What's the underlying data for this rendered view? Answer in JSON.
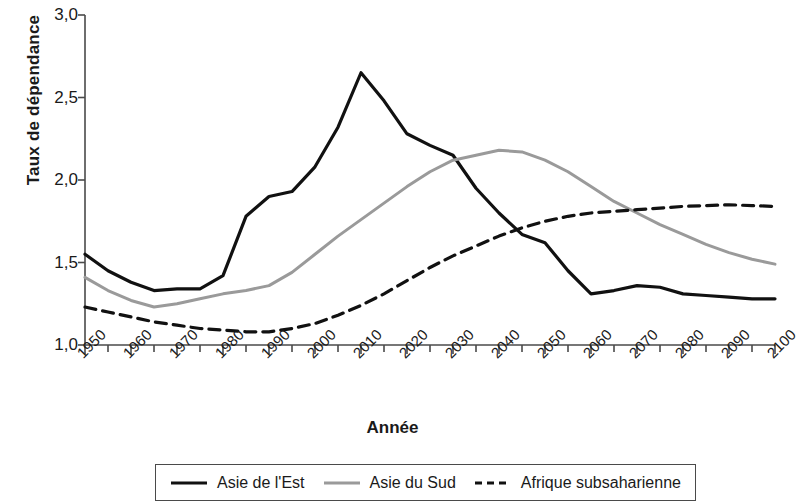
{
  "chart_data": {
    "type": "line",
    "title": "",
    "xlabel": "Année",
    "ylabel": "Taux de dépendance",
    "xlim": [
      1950,
      2100
    ],
    "ylim": [
      1.0,
      3.0
    ],
    "yticks": [
      "1,0",
      "1,5",
      "2,0",
      "2,5",
      "3,0"
    ],
    "ytick_values": [
      1.0,
      1.5,
      2.0,
      2.5,
      3.0
    ],
    "xticks": [
      "1950",
      "1960",
      "1970",
      "1980",
      "1990",
      "2000",
      "2010",
      "2020",
      "2030",
      "2040",
      "2050",
      "2060",
      "2070",
      "2080",
      "2090",
      "2100"
    ],
    "xtick_values": [
      1950,
      1960,
      1970,
      1980,
      1990,
      2000,
      2010,
      2020,
      2030,
      2040,
      2050,
      2060,
      2070,
      2080,
      2090,
      2100
    ],
    "minor_tick_step": 5,
    "grid": false,
    "legend_position": "bottom",
    "x": [
      1950,
      1955,
      1960,
      1965,
      1970,
      1975,
      1980,
      1985,
      1990,
      1995,
      2000,
      2005,
      2010,
      2015,
      2020,
      2025,
      2030,
      2035,
      2040,
      2045,
      2050,
      2055,
      2060,
      2065,
      2070,
      2075,
      2080,
      2085,
      2090,
      2095,
      2100
    ],
    "series": [
      {
        "name": "Asie de l'Est",
        "color": "#111111",
        "style": "solid",
        "width": 3.2,
        "values": [
          1.55,
          1.45,
          1.38,
          1.33,
          1.34,
          1.34,
          1.42,
          1.78,
          1.9,
          1.93,
          2.08,
          2.32,
          2.65,
          2.48,
          2.28,
          2.21,
          2.15,
          1.95,
          1.8,
          1.67,
          1.62,
          1.45,
          1.31,
          1.33,
          1.36,
          1.35,
          1.31,
          1.3,
          1.29,
          1.28,
          1.28
        ]
      },
      {
        "name": "Asie du Sud",
        "color": "#9a9a9a",
        "style": "solid",
        "width": 3.0,
        "values": [
          1.41,
          1.33,
          1.27,
          1.23,
          1.25,
          1.28,
          1.31,
          1.33,
          1.36,
          1.44,
          1.55,
          1.66,
          1.76,
          1.86,
          1.96,
          2.05,
          2.12,
          2.15,
          2.18,
          2.17,
          2.12,
          2.05,
          1.96,
          1.87,
          1.8,
          1.73,
          1.67,
          1.61,
          1.56,
          1.52,
          1.49
        ]
      },
      {
        "name": "Afrique subsaharienne",
        "color": "#111111",
        "style": "dashed",
        "width": 3.2,
        "values": [
          1.23,
          1.2,
          1.17,
          1.14,
          1.12,
          1.1,
          1.09,
          1.08,
          1.08,
          1.1,
          1.13,
          1.18,
          1.24,
          1.31,
          1.39,
          1.47,
          1.54,
          1.6,
          1.66,
          1.71,
          1.75,
          1.78,
          1.8,
          1.81,
          1.82,
          1.83,
          1.84,
          1.845,
          1.85,
          1.845,
          1.84
        ]
      }
    ]
  },
  "legend": {
    "items": [
      {
        "label": "Asie de l'Est"
      },
      {
        "label": "Asie du Sud"
      },
      {
        "label": "Afrique subsaharienne"
      }
    ]
  }
}
